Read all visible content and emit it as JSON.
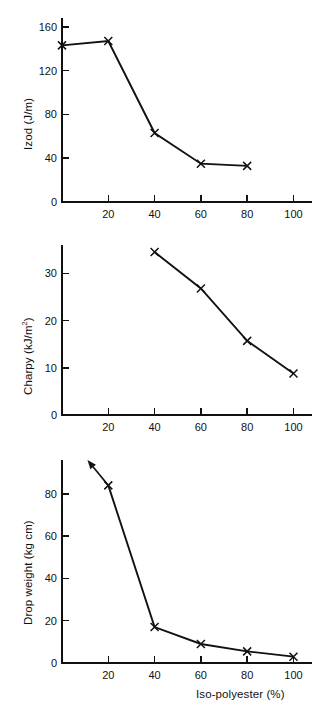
{
  "figure": {
    "panels": [
      {
        "id": "izod",
        "ylabel": "Izod (J/m)",
        "xlabel": ""
      },
      {
        "id": "charpy",
        "ylabel_prefix": "Charpy (kJ/m",
        "ylabel_sup": "2",
        "ylabel_suffix": ")",
        "xlabel": ""
      },
      {
        "id": "drop",
        "ylabel": "Drop weight (kg cm)",
        "xlabel": "Iso-polyester (%)"
      }
    ]
  },
  "chart_data": [
    {
      "type": "line",
      "title": "",
      "xlabel": "",
      "ylabel": "Izod (J/m)",
      "xlim": [
        0,
        108
      ],
      "ylim": [
        0,
        168
      ],
      "xticks": [
        20,
        40,
        60,
        80,
        100
      ],
      "xticklabels": [
        "20",
        "40",
        "60",
        "80",
        "100"
      ],
      "yticks": [
        0,
        40,
        80,
        120,
        160
      ],
      "yticklabels": [
        "0",
        "40",
        "80",
        "120",
        "160"
      ],
      "grid": false,
      "legend": false,
      "marker": "x",
      "x": [
        0,
        20,
        40,
        60,
        80
      ],
      "values": [
        143,
        147,
        63,
        35,
        33
      ]
    },
    {
      "type": "line",
      "title": "",
      "xlabel": "",
      "ylabel": "Charpy (kJ/m2)",
      "xlim": [
        0,
        108
      ],
      "ylim": [
        0,
        36
      ],
      "xticks": [
        20,
        40,
        60,
        80,
        100
      ],
      "xticklabels": [
        "20",
        "40",
        "60",
        "80",
        "100"
      ],
      "yticks": [
        0,
        10,
        20,
        30
      ],
      "yticklabels": [
        "0",
        "10",
        "20",
        "30"
      ],
      "grid": false,
      "legend": false,
      "marker": "x",
      "x": [
        40,
        60,
        80,
        100
      ],
      "values": [
        34.5,
        26.8,
        15.7,
        8.8
      ]
    },
    {
      "type": "line",
      "title": "",
      "xlabel": "Iso-polyester (%)",
      "ylabel": "Drop weight (kg cm)",
      "xlim": [
        0,
        108
      ],
      "ylim": [
        0,
        96
      ],
      "xticks": [
        20,
        40,
        60,
        80,
        100
      ],
      "xticklabels": [
        "20",
        "40",
        "60",
        "80",
        "100"
      ],
      "yticks": [
        0,
        20,
        40,
        60,
        80
      ],
      "yticklabels": [
        "0",
        "20",
        "40",
        "60",
        "80"
      ],
      "grid": false,
      "legend": false,
      "marker": "x",
      "x": [
        20,
        40,
        60,
        80,
        100
      ],
      "values": [
        84,
        17,
        9,
        5.5,
        3
      ],
      "annotations": [
        {
          "name": "off-scale-arrow",
          "from_x": 20,
          "from_y": 84,
          "to_x": 11,
          "to_y": 96,
          "note": "arrow indicating value exceeds plotted scale"
        }
      ]
    }
  ],
  "colors": {
    "ink": "#111111",
    "background": "#ffffff"
  }
}
